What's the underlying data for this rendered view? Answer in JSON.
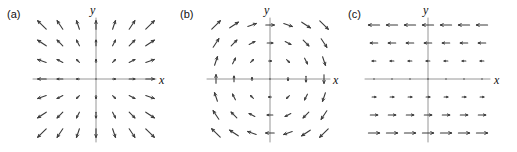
{
  "figure": {
    "width": 517,
    "height": 152,
    "background": "#ffffff",
    "ink_color": "#3a3a3a",
    "axis_color": "#8a8a8a",
    "text_color": "#111111"
  },
  "panels": [
    {
      "tag": "(a)",
      "tag_x": 7,
      "tag_y": 9,
      "origin_x": 96,
      "origin_y": 79,
      "x_axis_start": 33,
      "x_axis_end": 156,
      "y_axis_start": 18,
      "y_axis_end": 142,
      "xlabel": "x",
      "xlabel_x": 159,
      "xlabel_y": 74,
      "ylabel": "y",
      "ylabel_x": 90,
      "ylabel_y": 4,
      "field_type": "radial-outward",
      "field_formula": "F = (x, y)",
      "grid_n": 7,
      "grid_spacing": 18,
      "arrow_scale": 0.47,
      "max_arrow_len": 17
    },
    {
      "tag": "(b)",
      "tag_x": 180,
      "tag_y": 9,
      "origin_x": 270,
      "origin_y": 79,
      "x_axis_start": 207,
      "x_axis_end": 330,
      "y_axis_start": 18,
      "y_axis_end": 142,
      "xlabel": "x",
      "xlabel_x": 333,
      "xlabel_y": 74,
      "ylabel": "y",
      "ylabel_x": 264,
      "ylabel_y": 4,
      "field_type": "rotational-clockwise",
      "field_formula": "F = (y, -x)",
      "grid_n": 7,
      "grid_spacing": 18,
      "arrow_scale": 0.47,
      "max_arrow_len": 17
    },
    {
      "tag": "(c)",
      "tag_x": 348,
      "tag_y": 9,
      "origin_x": 428,
      "origin_y": 79,
      "x_axis_start": 365,
      "x_axis_end": 490,
      "y_axis_start": 18,
      "y_axis_end": 142,
      "xlabel": "x",
      "xlabel_x": 494,
      "xlabel_y": 74,
      "ylabel": "y",
      "ylabel_x": 423,
      "ylabel_y": 4,
      "field_type": "shear-horizontal-negative",
      "field_formula": "F = (-y, 0)",
      "grid_n": 7,
      "grid_spacing": 18,
      "arrow_scale": 0.62,
      "max_arrow_len": 22
    }
  ],
  "chart_data": {
    "type": "vector-field-quiver-triptych",
    "title": "",
    "panel_count": 3,
    "shared": {
      "xlabel": "x",
      "ylabel": "y",
      "grid_points_per_axis": 7,
      "grid_values": [
        -3,
        -2,
        -1,
        0,
        1,
        2,
        3
      ],
      "xlim": [
        -3.5,
        3.5
      ],
      "ylim": [
        -3.5,
        3.5
      ],
      "axes_shown": [
        "x",
        "y"
      ],
      "ticks_shown": false,
      "grid_shown": false,
      "legend": "none"
    },
    "panels": [
      {
        "label": "(a)",
        "description": "Radially outward (source) vector field; arrow length grows with distance from the origin.",
        "u_formula": "x",
        "v_formula": "y",
        "divergence": 2,
        "curl": 0,
        "samples": [
          {
            "x": -3,
            "y": 3,
            "u": -3,
            "v": 3
          },
          {
            "x": 0,
            "y": 3,
            "u": 0,
            "v": 3
          },
          {
            "x": 3,
            "y": 3,
            "u": 3,
            "v": 3
          },
          {
            "x": -3,
            "y": 0,
            "u": -3,
            "v": 0
          },
          {
            "x": 0,
            "y": 0,
            "u": 0,
            "v": 0
          },
          {
            "x": 3,
            "y": 0,
            "u": 3,
            "v": 0
          },
          {
            "x": -3,
            "y": -3,
            "u": -3,
            "v": -3
          },
          {
            "x": 0,
            "y": -3,
            "u": 0,
            "v": -3
          },
          {
            "x": 3,
            "y": -3,
            "u": 3,
            "v": -3
          }
        ]
      },
      {
        "label": "(b)",
        "description": "Clockwise rotational (vortex) vector field; arrow length grows with distance from the origin.",
        "u_formula": "y",
        "v_formula": "-x",
        "divergence": 0,
        "curl": -2,
        "samples": [
          {
            "x": -3,
            "y": 3,
            "u": 3,
            "v": 3
          },
          {
            "x": 0,
            "y": 3,
            "u": 3,
            "v": 0
          },
          {
            "x": 3,
            "y": 3,
            "u": 3,
            "v": -3
          },
          {
            "x": -3,
            "y": 0,
            "u": 0,
            "v": 3
          },
          {
            "x": 0,
            "y": 0,
            "u": 0,
            "v": 0
          },
          {
            "x": 3,
            "y": 0,
            "u": 0,
            "v": -3
          },
          {
            "x": -3,
            "y": -3,
            "u": -3,
            "v": 3
          },
          {
            "x": 0,
            "y": -3,
            "u": -3,
            "v": 0
          },
          {
            "x": 3,
            "y": -3,
            "u": -3,
            "v": -3
          }
        ]
      },
      {
        "label": "(c)",
        "description": "Horizontal shear field; all arrows are horizontal, pointing in the negative x direction above the x-axis and positive x direction below, with magnitude proportional to |y|.",
        "u_formula": "-y",
        "v_formula": "0",
        "divergence": 0,
        "curl": 1,
        "samples": [
          {
            "x": -3,
            "y": 3,
            "u": -3,
            "v": 0
          },
          {
            "x": 0,
            "y": 3,
            "u": -3,
            "v": 0
          },
          {
            "x": 3,
            "y": 3,
            "u": -3,
            "v": 0
          },
          {
            "x": -3,
            "y": 0,
            "u": 0,
            "v": 0
          },
          {
            "x": 0,
            "y": 0,
            "u": 0,
            "v": 0
          },
          {
            "x": 3,
            "y": 0,
            "u": 0,
            "v": 0
          },
          {
            "x": -3,
            "y": -3,
            "u": 3,
            "v": 0
          },
          {
            "x": 0,
            "y": -3,
            "u": 3,
            "v": 0
          },
          {
            "x": 3,
            "y": -3,
            "u": 3,
            "v": 0
          }
        ]
      }
    ]
  }
}
